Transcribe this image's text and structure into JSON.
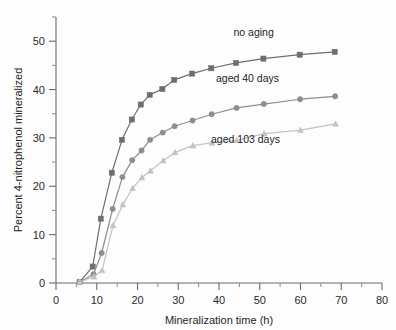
{
  "figure": {
    "background_color": "#fdfdfd",
    "axis_color": "#6b6b6b",
    "text_color": "#1d1d1d"
  },
  "chart_data": {
    "type": "line",
    "title": "",
    "subtitle": "",
    "xlabel": "Mineralization time (h)",
    "ylabel": "Percent 4-nitrophenol mineralized",
    "xlim": [
      0,
      80
    ],
    "ylim": [
      0,
      55
    ],
    "xticks": [
      0,
      10,
      20,
      30,
      40,
      50,
      60,
      70,
      80
    ],
    "yticks": [
      0,
      10,
      20,
      30,
      40,
      50
    ],
    "xticklabels": [
      "0",
      "10",
      "20",
      "30",
      "40",
      "50",
      "60",
      "70",
      "80"
    ],
    "yticklabels": [
      "0",
      "10",
      "20",
      "30",
      "40",
      "50"
    ],
    "xminorticks": [
      5,
      15,
      25,
      35,
      45,
      55,
      65,
      75
    ],
    "yminorticks": [
      5,
      15,
      25,
      35,
      45,
      55
    ],
    "grid": false,
    "legend_position": "inline-annotations",
    "series": [
      {
        "name": "no aging",
        "label": "no aging",
        "color": "#6e6e6e",
        "marker": "square",
        "marker_size": 5.2,
        "line_width": 1.2,
        "label_x": 48.5,
        "label_y": 51.0,
        "x": [
          5.8,
          9.0,
          11.0,
          13.7,
          16.2,
          18.6,
          20.8,
          23.0,
          26.1,
          29.0,
          33.4,
          38.1,
          44.2,
          50.9,
          59.8,
          68.4
        ],
        "y": [
          0.2,
          3.4,
          13.3,
          22.8,
          29.6,
          33.8,
          36.9,
          38.9,
          40.1,
          42.0,
          43.3,
          44.4,
          45.5,
          46.4,
          47.2,
          47.8
        ]
      },
      {
        "name": "aged 40 days",
        "label": "aged 40 days",
        "color": "#8e8e8e",
        "marker": "circle",
        "marker_size": 5.4,
        "line_width": 1.2,
        "label_x": 47.0,
        "label_y": 41.5,
        "x": [
          5.8,
          9.2,
          11.2,
          13.9,
          16.3,
          18.7,
          21.0,
          23.1,
          26.2,
          29.1,
          33.5,
          38.2,
          44.3,
          51.0,
          59.9,
          68.5
        ],
        "y": [
          0.2,
          1.8,
          6.2,
          15.3,
          21.9,
          25.4,
          27.4,
          29.6,
          31.1,
          32.4,
          33.6,
          34.9,
          36.2,
          37.0,
          38.0,
          38.6
        ]
      },
      {
        "name": "aged 103 days",
        "label": "aged 103 days",
        "color": "#c2c2c2",
        "marker": "triangle",
        "marker_size": 5.4,
        "line_width": 1.2,
        "label_x": 46.5,
        "label_y": 29.0,
        "x": [
          5.8,
          9.3,
          11.3,
          14.0,
          16.4,
          18.8,
          21.1,
          23.2,
          26.3,
          29.2,
          33.6,
          38.3,
          44.4,
          51.1,
          60.0,
          68.6
        ],
        "y": [
          0.2,
          1.3,
          2.6,
          11.9,
          16.2,
          19.6,
          21.8,
          23.2,
          25.3,
          27.0,
          28.4,
          29.0,
          29.5,
          30.9,
          31.6,
          32.9
        ]
      }
    ]
  }
}
